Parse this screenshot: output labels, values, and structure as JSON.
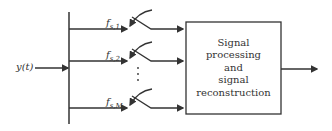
{
  "diagram": {
    "input_label": "y(t)",
    "branches": [
      {
        "f": "f",
        "sub": "s,1"
      },
      {
        "f": "f",
        "sub": "s,2"
      },
      {
        "f": "f",
        "sub": "s,M"
      }
    ],
    "ellipsis": "⋮",
    "block": {
      "lines": [
        "Signal",
        "processing",
        "and",
        "signal",
        "reconstruction"
      ]
    },
    "colors": {
      "line": "#333333",
      "background": "#ffffff"
    }
  }
}
